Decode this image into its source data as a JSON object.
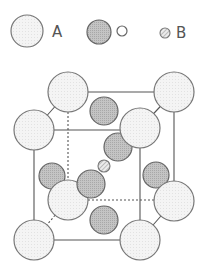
{
  "legend": [
    {
      "label": "A",
      "symbol": "large-light-circle"
    },
    {
      "label": "O",
      "symbol": "medium-gray-circle"
    },
    {
      "label": "B",
      "symbol": "small-hatched-circle"
    }
  ],
  "colors": {
    "outline": "#707070",
    "atom_a_fill": "#f1f1f1",
    "atom_o_fill": "#bdbdbd",
    "atom_b_fill": "#d8d8d8",
    "edge": "#555555"
  }
}
